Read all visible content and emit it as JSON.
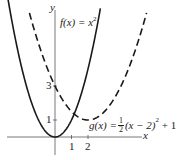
{
  "chart_data": {
    "type": "line",
    "title": "",
    "xlabel": "x",
    "ylabel": "y",
    "x_ticks": [
      1,
      2
    ],
    "y_ticks": [
      1,
      3
    ],
    "xlim": [
      -3.2,
      5.4
    ],
    "ylim": [
      -1,
      7.6
    ],
    "grid": false,
    "series": [
      {
        "name": "f(x) = x^2",
        "label": "f(x) = x²",
        "style": "solid",
        "formula": "x^2",
        "points": [
          [
            -2.9,
            8.41
          ],
          [
            -2,
            4
          ],
          [
            -1,
            1
          ],
          [
            0,
            0
          ],
          [
            1,
            1
          ],
          [
            2,
            4
          ],
          [
            2.7,
            7.29
          ]
        ]
      },
      {
        "name": "g(x) = 1/2 (x - 2)^2 + 1",
        "label": "g(x) = ½(x − 2)² + 1",
        "style": "dashed",
        "formula": "0.5*(x-2)^2+1",
        "points": [
          [
            -1.5,
            7.125
          ],
          [
            0,
            3
          ],
          [
            1,
            1.5
          ],
          [
            2,
            1
          ],
          [
            3,
            1.5
          ],
          [
            4,
            3
          ],
          [
            5.5,
            7.125
          ]
        ]
      }
    ],
    "annotations": [
      "f(x) = x²",
      "g(x) = ½(x − 2)² + 1"
    ]
  },
  "labels": {
    "y_axis": "y",
    "x_axis": "x",
    "tick_x1": "1",
    "tick_x2": "2",
    "tick_y1": "1",
    "tick_y3": "3",
    "f_label_lhs": "f(x) = x",
    "f_label_exp": "2",
    "g_label_lhs": "g(x) = ",
    "g_label_num": "1",
    "g_label_den": "2",
    "g_label_mid": "(x − 2)",
    "g_label_exp": "2",
    "g_label_tail": " + 1"
  },
  "colors": {
    "curve": "#1a1a1a",
    "axis": "#555555"
  }
}
